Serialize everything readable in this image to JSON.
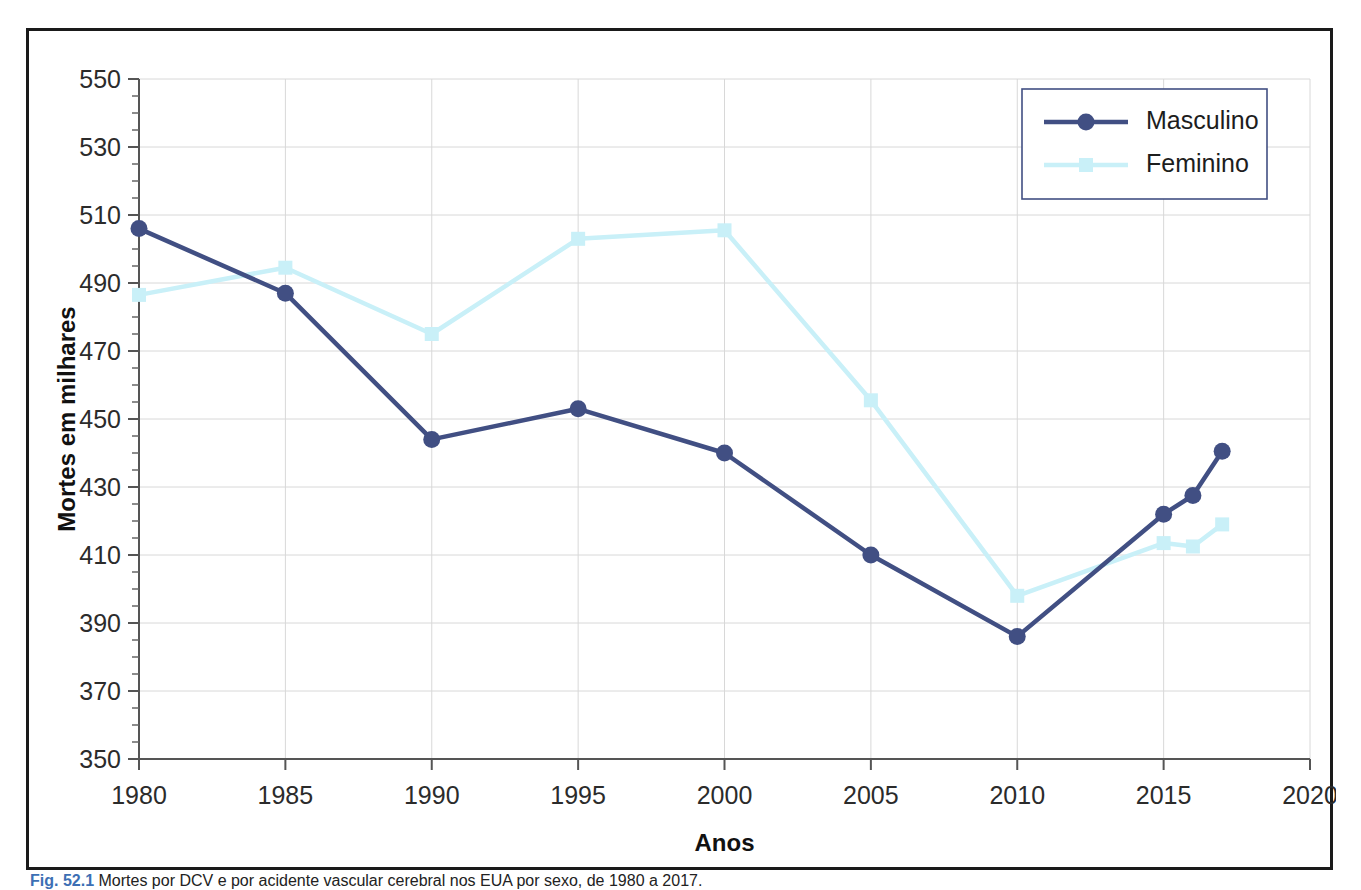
{
  "figure": {
    "caption_prefix": "Fig. 52.1",
    "caption_text": "Mortes por DCV e por acidente vascular cerebral nos EUA por sexo, de 1980 a 2017.",
    "frame_color": "#1a1a1a"
  },
  "chart_data": {
    "type": "line",
    "title": "",
    "xlabel": "Anos",
    "ylabel": "Mortes em milhares",
    "xlim": [
      1980,
      2020
    ],
    "ylim": [
      350,
      550
    ],
    "xticks": [
      1980,
      1985,
      1990,
      1995,
      2000,
      2005,
      2010,
      2015,
      2020
    ],
    "yticks": [
      350,
      370,
      390,
      410,
      430,
      450,
      470,
      490,
      510,
      530,
      550
    ],
    "grid": true,
    "legend_position": "top-right",
    "series": [
      {
        "name": "Masculino",
        "color": "#414f83",
        "marker": "circle",
        "x": [
          1980,
          1985,
          1990,
          1995,
          2000,
          2005,
          2010,
          2015,
          2016,
          2017
        ],
        "values": [
          506,
          487,
          444,
          453,
          440,
          410,
          386,
          422,
          427.5,
          440.5
        ]
      },
      {
        "name": "Feminino",
        "color": "#c9f0f8",
        "marker": "square",
        "x": [
          1980,
          1985,
          1990,
          1995,
          2000,
          2005,
          2010,
          2015,
          2016,
          2017
        ],
        "values": [
          486.5,
          494.5,
          475,
          503,
          505.5,
          455.5,
          398,
          413.5,
          412.5,
          419
        ]
      }
    ]
  },
  "legend": {
    "entries": [
      {
        "label": "Masculino"
      },
      {
        "label": "Feminino"
      }
    ],
    "border_color": "#414f83"
  }
}
